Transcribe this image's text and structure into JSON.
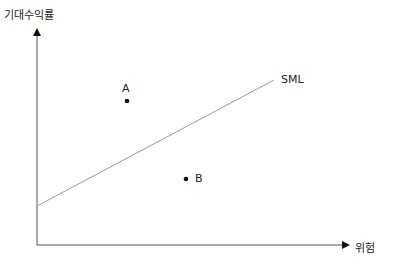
{
  "diagram": {
    "y_axis_label": "기대수익률",
    "x_axis_label": "위험",
    "line_label": "SML",
    "points": [
      {
        "label": "A"
      },
      {
        "label": "B"
      }
    ]
  },
  "colors": {
    "axis": "#333333",
    "line": "#888888",
    "point": "#111111"
  }
}
